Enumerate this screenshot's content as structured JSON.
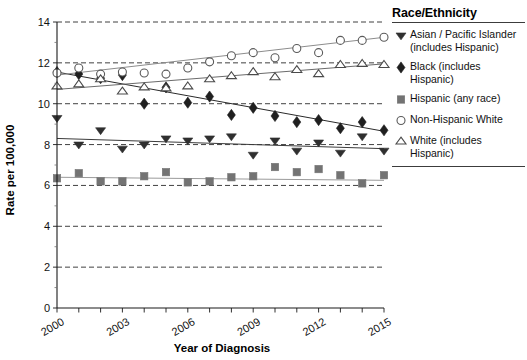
{
  "chart_data": {
    "type": "scatter",
    "title": "",
    "xlabel": "Year of Diagnosis",
    "ylabel": "Rate per 100,000",
    "xlim": [
      2000,
      2015
    ],
    "ylim": [
      0,
      14
    ],
    "ytick_labels": [
      "0",
      "2",
      "4",
      "6",
      "8",
      "10",
      "12",
      "14"
    ],
    "yticks": [
      0,
      2,
      4,
      6,
      8,
      10,
      12,
      14
    ],
    "xticks": [
      2000,
      2001,
      2002,
      2003,
      2004,
      2005,
      2006,
      2007,
      2008,
      2009,
      2010,
      2011,
      2012,
      2013,
      2014,
      2015
    ],
    "xtick_labels": [
      "2000",
      "",
      "",
      "2003",
      "",
      "",
      "2006",
      "",
      "",
      "2009",
      "",
      "",
      "2012",
      "",
      "",
      "2015"
    ],
    "grid": "horizontal-dashed",
    "legend_position": "right",
    "x": [
      2000,
      2001,
      2002,
      2003,
      2004,
      2005,
      2006,
      2007,
      2008,
      2009,
      2010,
      2011,
      2012,
      2013,
      2014,
      2015
    ],
    "series": [
      {
        "name": "Asian / Pacific Islander (includes Hispanic)",
        "marker": "triangle-down-filled",
        "color": "#2f2f2f",
        "values": [
          9.3,
          8.0,
          8.7,
          7.8,
          8.0,
          8.3,
          8.2,
          8.3,
          8.4,
          7.5,
          8.2,
          7.7,
          8.1,
          7.6,
          8.4,
          7.7
        ],
        "trend_start": 8.3,
        "trend_end": 7.8
      },
      {
        "name": "Black (includes Hispanic)",
        "marker": "diamond-filled",
        "color": "#1f1f1f",
        "values": [
          11.55,
          11.45,
          11.25,
          11.4,
          10.0,
          10.8,
          10.05,
          10.35,
          9.45,
          9.8,
          9.4,
          9.1,
          9.2,
          8.8,
          9.1,
          8.7
        ],
        "trend_start": 11.55,
        "trend_end": 8.65
      },
      {
        "name": "Hispanic (any race)",
        "marker": "square-filled",
        "color": "#737373",
        "values": [
          6.35,
          6.6,
          6.2,
          6.2,
          6.45,
          6.65,
          6.15,
          6.2,
          6.4,
          6.45,
          6.9,
          6.65,
          6.8,
          6.5,
          6.1,
          6.5
        ],
        "trend_start": 6.4,
        "trend_end": 6.25
      },
      {
        "name": "Non-Hispanic White",
        "marker": "circle-open",
        "color": "#5a5a5a",
        "values": [
          11.5,
          11.75,
          11.45,
          11.55,
          11.5,
          11.45,
          11.75,
          12.05,
          12.35,
          12.5,
          12.25,
          12.7,
          12.5,
          13.1,
          13.1,
          13.25
        ],
        "trend_start": 11.4,
        "trend_end": 13.25
      },
      {
        "name": "White (includes Hispanic)",
        "marker": "triangle-up-open",
        "color": "#4a4a4a",
        "values": [
          10.85,
          10.95,
          11.2,
          10.6,
          10.8,
          10.75,
          10.85,
          11.2,
          11.35,
          11.55,
          11.3,
          11.65,
          11.45,
          11.9,
          11.95,
          11.9
        ],
        "trend_start": 10.7,
        "trend_end": 11.95
      }
    ]
  },
  "legend": {
    "title": "Race/Ethnicity",
    "items": [
      {
        "marker": "triangle-down-filled",
        "label": "Asian / Pacific Islander (includes Hispanic)"
      },
      {
        "marker": "diamond-filled",
        "label": "Black (includes Hispanic)"
      },
      {
        "marker": "square-filled",
        "label": "Hispanic (any race)"
      },
      {
        "marker": "circle-open",
        "label": "Non-Hispanic White"
      },
      {
        "marker": "triangle-up-open",
        "label": "White (includes Hispanic)"
      }
    ]
  },
  "colors": {
    "axis": "#1a1a1a",
    "grid": "#2b2b2b",
    "background": "#ffffff"
  }
}
